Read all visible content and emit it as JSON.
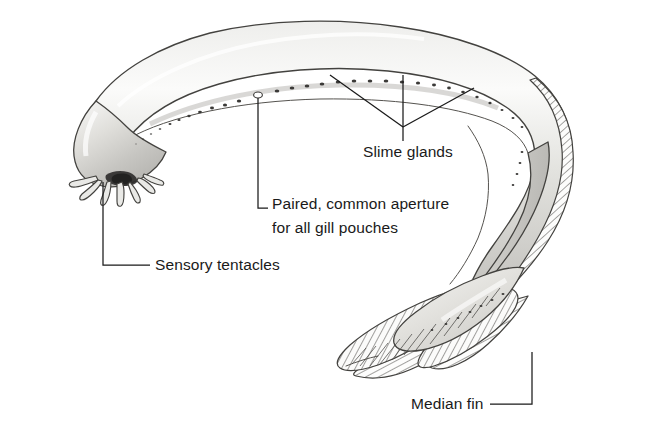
{
  "figure": {
    "background_color": "#ffffff",
    "ink_color": "#1a1a1a",
    "body_fill_light": "#f2f2f0",
    "body_fill_mid": "#cfcfcb",
    "body_fill_dark": "#a9a8a4",
    "outline_color": "#43423f",
    "width": 656,
    "height": 433
  },
  "labels": {
    "slime_glands": {
      "text": "Slime glands",
      "x": 363,
      "y": 157
    },
    "gill_aperture_line1": {
      "text": "Paired, common aperture",
      "x": 272,
      "y": 209
    },
    "gill_aperture_line2": {
      "text": "for all gill pouches",
      "x": 272,
      "y": 233
    },
    "sensory_tentacles": {
      "text": "Sensory tentacles",
      "x": 155,
      "y": 270
    },
    "median_fin": {
      "text": "Median fin",
      "x": 411,
      "y": 409
    }
  },
  "anatomy_parts": [
    {
      "name": "slime-glands",
      "label": "Slime glands",
      "description": "row of pores along the lateral body line"
    },
    {
      "name": "gill-aperture",
      "label": "Paired, common aperture for all gill pouches",
      "description": "single enlarged opening"
    },
    {
      "name": "sensory-tentacles",
      "label": "Sensory tentacles",
      "description": "barbels around the mouth"
    },
    {
      "name": "median-fin",
      "label": "Median fin",
      "description": "hatched caudal fin fold"
    }
  ],
  "icons": {
    "pore": "slime-pore-dot",
    "aperture": "gill-aperture-ring"
  }
}
